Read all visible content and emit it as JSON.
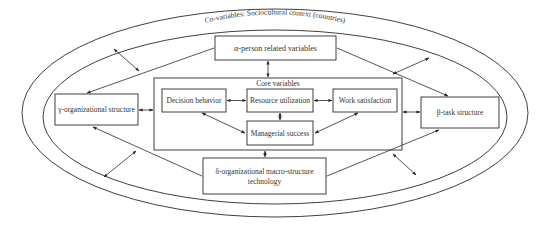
{
  "diagram": {
    "outer_context_label": "Co-variables: Sociocultural context (countries)",
    "alpha": {
      "label": "α-person related variables"
    },
    "beta": {
      "label": "β-task structure"
    },
    "gamma": {
      "label": "γ-organizational structure"
    },
    "delta": {
      "line1": "δ-organizational macro-structure",
      "line2": "technology"
    },
    "core": {
      "title": "Core variables",
      "decision_behavior": "Decision behavior",
      "resource_utilization": "Resource utilization",
      "work_satisfaction": "Work satisfaction",
      "managerial_success": "Managerial success"
    },
    "colors": {
      "stroke": "#2a2a2a",
      "text": "#333333",
      "background": "#ffffff"
    }
  }
}
